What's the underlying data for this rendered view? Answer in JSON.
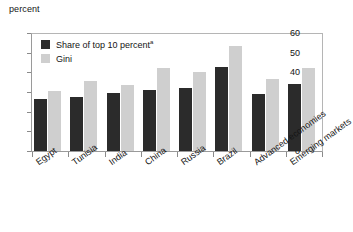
{
  "chart_data": {
    "type": "bar",
    "title": "",
    "subtitle": "",
    "unit_label": "percent",
    "xlabel": "",
    "ylabel": "",
    "ylim": [
      0,
      60
    ],
    "yticks": [
      0,
      10,
      20,
      30,
      40,
      50,
      60
    ],
    "grid": false,
    "legend_position": "top-left",
    "categories": [
      "Egypt",
      "Tunisia",
      "India",
      "China",
      "Russia",
      "Brazil",
      "Advanced economies",
      "Emerging markets"
    ],
    "series": [
      {
        "name": "Share of top 10 percent",
        "name_superscript": "a",
        "color": "#2b2b2b",
        "values": [
          26.6,
          27.5,
          29.4,
          30.8,
          32.1,
          42.8,
          29.1,
          34.2
        ]
      },
      {
        "name": "Gini",
        "name_superscript": "",
        "color": "#cfcfcf",
        "values": [
          30.4,
          35.6,
          33.8,
          42.1,
          40.2,
          53.3,
          36.4,
          42.1
        ]
      }
    ],
    "annotations": []
  }
}
